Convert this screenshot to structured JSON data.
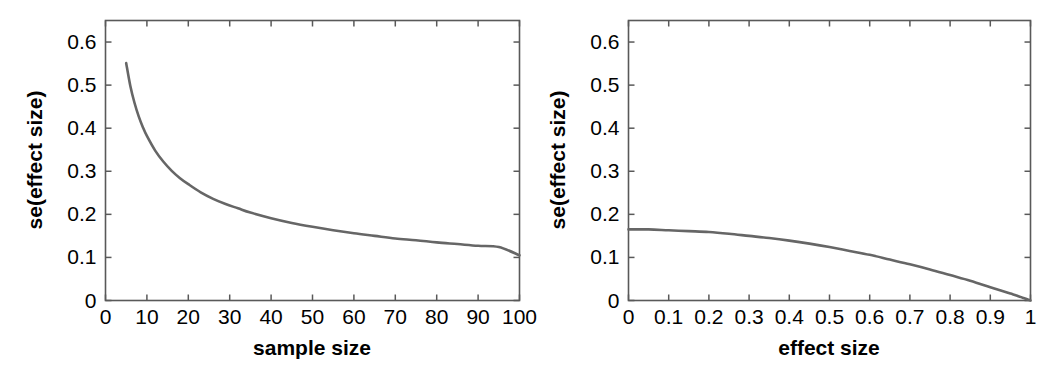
{
  "figure": {
    "background_color": "#ffffff",
    "axis_color": "#595959",
    "curve_color": "#666666",
    "panel_count": 2
  },
  "chart_data": [
    {
      "type": "line",
      "panel": "left",
      "title": "",
      "xlabel": "sample size",
      "ylabel": "se(effect size)",
      "xlim": [
        0,
        100
      ],
      "ylim": [
        0,
        0.65
      ],
      "xticks": [
        0,
        10,
        20,
        30,
        40,
        50,
        60,
        70,
        80,
        90,
        100
      ],
      "xticklabels": [
        "0",
        "10",
        "20",
        "30",
        "40",
        "50",
        "60",
        "70",
        "80",
        "90",
        "100"
      ],
      "yticks": [
        0,
        0.1,
        0.2,
        0.3,
        0.4,
        0.5,
        0.6
      ],
      "yticklabels": [
        "0",
        "0.1",
        "0.2",
        "0.3",
        "0.4",
        "0.5",
        "0.6"
      ],
      "grid": false,
      "legend": false,
      "x": [
        5,
        6,
        7,
        8,
        9,
        10,
        12,
        14,
        16,
        18,
        20,
        23,
        26,
        29,
        32,
        35,
        40,
        45,
        50,
        55,
        60,
        65,
        70,
        75,
        80,
        85,
        90,
        95,
        100
      ],
      "values": [
        0.551,
        0.498,
        0.459,
        0.428,
        0.403,
        0.382,
        0.348,
        0.322,
        0.301,
        0.284,
        0.27,
        0.251,
        0.236,
        0.224,
        0.214,
        0.204,
        0.191,
        0.18,
        0.171,
        0.163,
        0.156,
        0.15,
        0.144,
        0.14,
        0.135,
        0.131,
        0.127,
        0.124,
        0.105
      ],
      "series_name": "se vs sample size",
      "note": "monotonically decreasing ~ 1/sqrt(n); starts 0.551 at n=5, ends ~0.105 at n=100"
    },
    {
      "type": "line",
      "panel": "right",
      "title": "",
      "xlabel": "effect size",
      "ylabel": "se(effect size)",
      "xlim": [
        0,
        1
      ],
      "ylim": [
        0,
        0.65
      ],
      "xticks": [
        0,
        0.1,
        0.2,
        0.3,
        0.4,
        0.5,
        0.6,
        0.7,
        0.8,
        0.9,
        1
      ],
      "xticklabels": [
        "0",
        "0.1",
        "0.2",
        "0.3",
        "0.4",
        "0.5",
        "0.6",
        "0.7",
        "0.8",
        "0.9",
        "1"
      ],
      "yticks": [
        0,
        0.1,
        0.2,
        0.3,
        0.4,
        0.5,
        0.6
      ],
      "yticklabels": [
        "0",
        "0.1",
        "0.2",
        "0.3",
        "0.4",
        "0.5",
        "0.6"
      ],
      "grid": false,
      "legend": false,
      "x": [
        0,
        0.05,
        0.1,
        0.15,
        0.2,
        0.25,
        0.3,
        0.35,
        0.4,
        0.45,
        0.5,
        0.55,
        0.6,
        0.65,
        0.7,
        0.75,
        0.8,
        0.85,
        0.9,
        0.93,
        0.95,
        0.97,
        0.98,
        0.99,
        0.995,
        1
      ],
      "values": [
        0.165,
        0.165,
        0.163,
        0.161,
        0.159,
        0.155,
        0.15,
        0.145,
        0.139,
        0.132,
        0.124,
        0.115,
        0.106,
        0.095,
        0.084,
        0.072,
        0.059,
        0.046,
        0.031,
        0.022,
        0.016,
        0.01,
        0.0065,
        0.0033,
        0.0016,
        0.0
      ],
      "series_name": "se vs effect size",
      "note": "flat near 0.165 then falls to 0 at effect size = 1; proportional to (1 - d^2)"
    }
  ]
}
